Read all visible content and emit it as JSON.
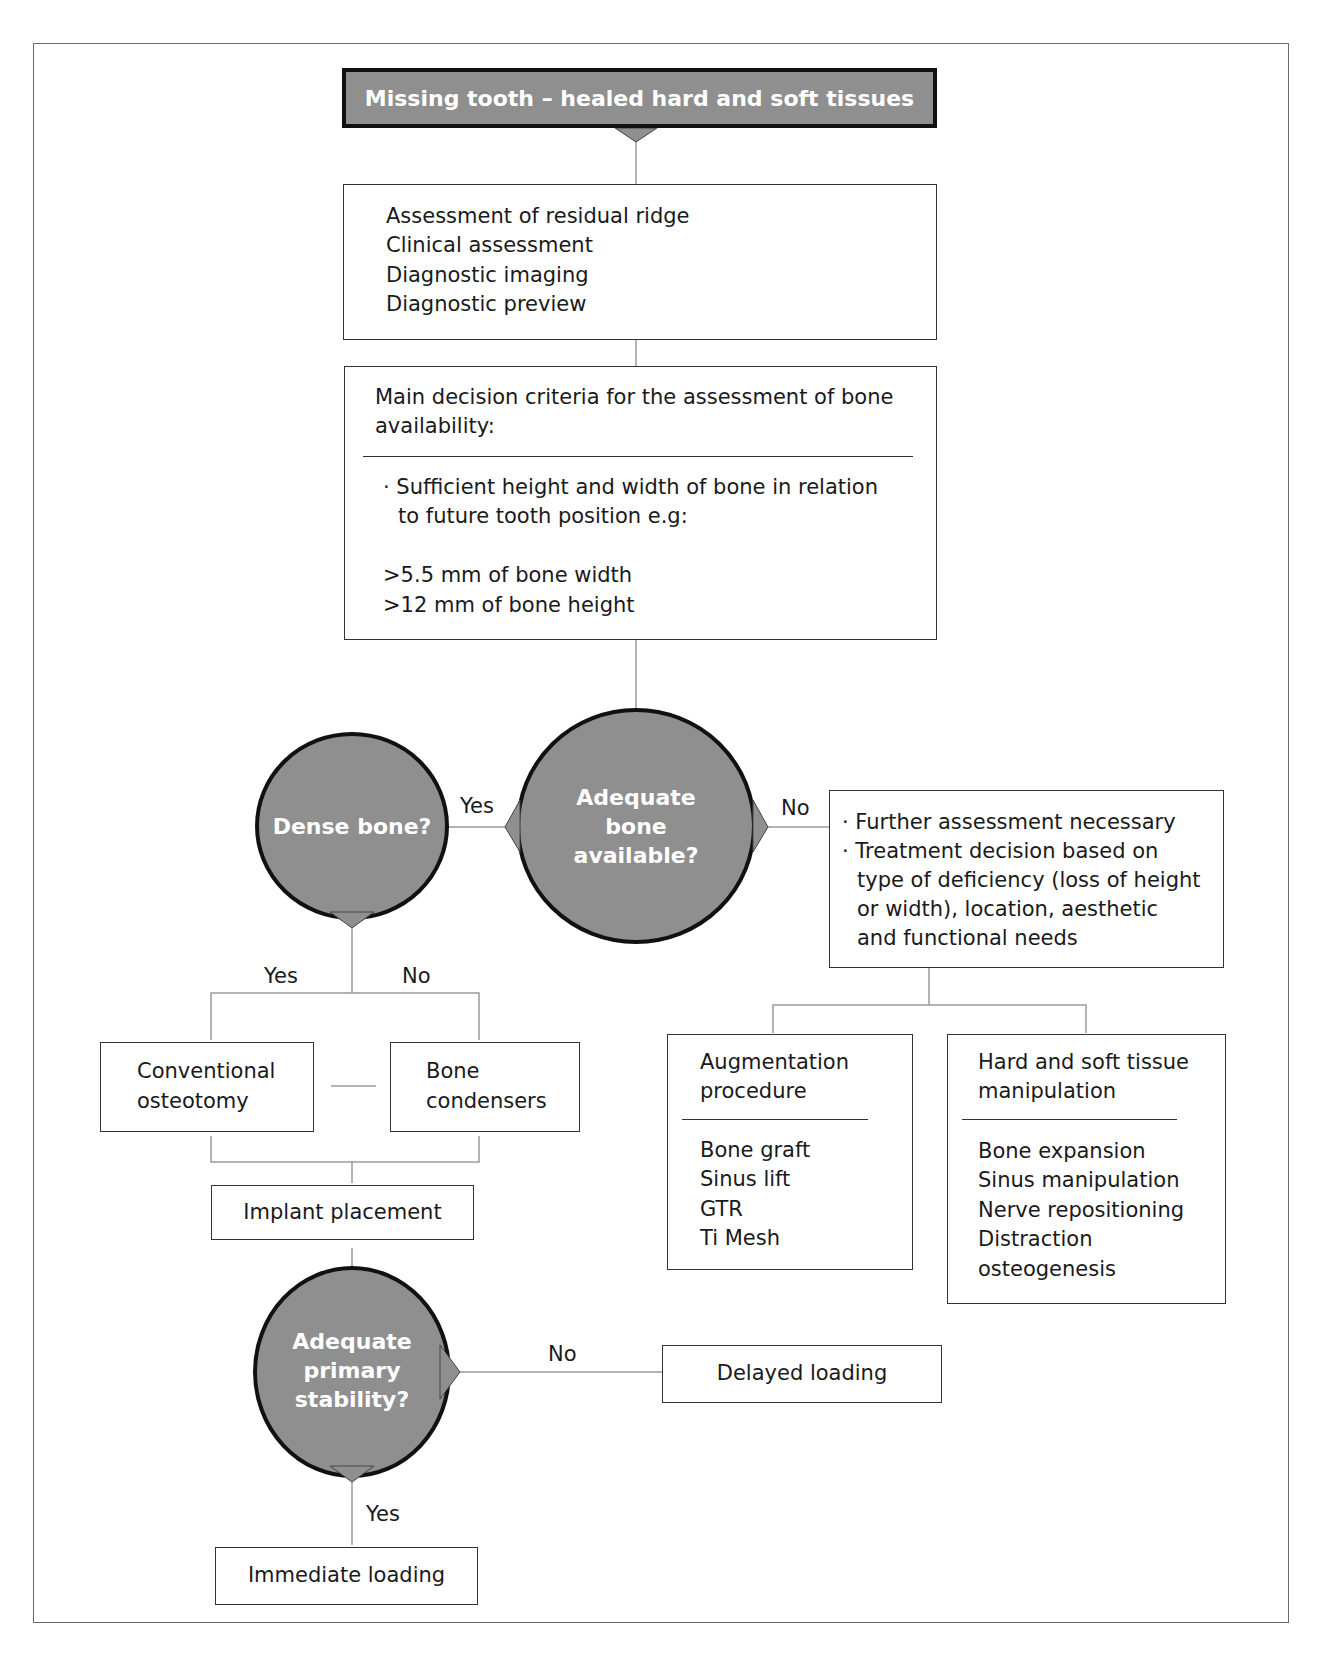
{
  "diagram": {
    "title": "Missing tooth – healed hard and soft tissues",
    "assessment": {
      "items": [
        "Assessment of residual ridge",
        "Clinical assessment",
        "Diagnostic imaging",
        "Diagnostic preview"
      ]
    },
    "criteria": {
      "heading_line1": "Main decision criteria for the assessment of bone",
      "heading_line2": "availability:",
      "bullet_line1": "· Sufficient height and width of bone in relation",
      "bullet_line2": "to future tooth position e.g:",
      "req_width": ">5.5 mm of bone width",
      "req_height": ">12 mm of bone height"
    },
    "decision_bone": {
      "line1": "Adequate",
      "line2": "bone",
      "line3": "available?",
      "yes": "Yes",
      "no": "No"
    },
    "decision_dense": {
      "label": "Dense bone?",
      "yes": "Yes",
      "no": "No"
    },
    "further": {
      "line1": "· Further assessment necessary",
      "line2": "· Treatment decision based on",
      "line3": "type of deficiency (loss of height",
      "line4": "or width), location, aesthetic",
      "line5": "and functional needs"
    },
    "conventional": {
      "line1": "Conventional",
      "line2": "osteotomy"
    },
    "condensers": {
      "line1": "Bone",
      "line2": "condensers"
    },
    "augmentation": {
      "heading_line1": "Augmentation",
      "heading_line2": "procedure",
      "items": [
        "Bone graft",
        "Sinus lift",
        "GTR",
        "Ti Mesh"
      ]
    },
    "manipulation": {
      "heading_line1": "Hard and soft tissue",
      "heading_line2": "manipulation",
      "items": [
        "Bone expansion",
        "Sinus manipulation",
        "Nerve repositioning",
        "Distraction",
        "osteogenesis"
      ]
    },
    "implant": "Implant placement",
    "decision_stability": {
      "line1": "Adequate",
      "line2": "primary",
      "line3": "stability?",
      "yes": "Yes",
      "no": "No"
    },
    "delayed": "Delayed loading",
    "immediate": "Immediate loading"
  },
  "colors": {
    "node_fill": "#8f8f8f",
    "node_border": "#111111",
    "line": "#9a9a9a",
    "text": "#1a1a1a"
  }
}
